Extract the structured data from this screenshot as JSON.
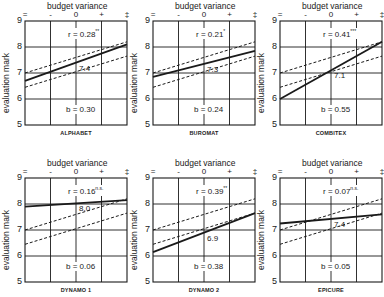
{
  "chart_data": [
    {
      "type": "line",
      "title": "ALPHABET",
      "xlabel": "budget variance",
      "ylabel": "evaluation mark",
      "x_ticks": [
        "=",
        "-",
        "0",
        "+",
        "‡"
      ],
      "y_ticks": [
        5,
        6,
        7,
        8,
        9
      ],
      "ylim": [
        5,
        9
      ],
      "grid": true,
      "series": [
        {
          "name": "regression",
          "style": "solid",
          "x": [
            -2,
            2
          ],
          "y": [
            6.7,
            8.1
          ]
        },
        {
          "name": "reference upper",
          "style": "dashed",
          "x": [
            -2,
            2
          ],
          "y": [
            7.0,
            8.2
          ]
        },
        {
          "name": "reference lower",
          "style": "dashed",
          "x": [
            -2,
            2
          ],
          "y": [
            6.45,
            7.65
          ]
        }
      ],
      "r": "0.28",
      "r_sig": "**",
      "b": "0.30",
      "mean_label": "7.4"
    },
    {
      "type": "line",
      "title": "BUROMAT",
      "xlabel": "budget variance",
      "ylabel": "evaluation mark",
      "x_ticks": [
        "=",
        "-",
        "0",
        "+",
        "‡"
      ],
      "y_ticks": [
        5,
        6,
        7,
        8,
        9
      ],
      "ylim": [
        5,
        9
      ],
      "grid": true,
      "series": [
        {
          "name": "regression",
          "style": "solid",
          "x": [
            -2,
            2
          ],
          "y": [
            6.85,
            7.85
          ]
        },
        {
          "name": "reference upper",
          "style": "dashed",
          "x": [
            -2,
            2
          ],
          "y": [
            7.0,
            8.2
          ]
        },
        {
          "name": "reference lower",
          "style": "dashed",
          "x": [
            -2,
            2
          ],
          "y": [
            6.45,
            7.65
          ]
        }
      ],
      "r": "0.21",
      "r_sig": "*",
      "b": "0.24",
      "mean_label": "7.3"
    },
    {
      "type": "line",
      "title": "COMBITEX",
      "xlabel": "budget variance",
      "ylabel": "evaluation mark",
      "x_ticks": [
        "=",
        "-",
        "0",
        "+",
        "‡"
      ],
      "y_ticks": [
        5,
        6,
        7,
        8,
        9
      ],
      "ylim": [
        5,
        9
      ],
      "grid": true,
      "series": [
        {
          "name": "regression",
          "style": "solid",
          "x": [
            -2,
            2
          ],
          "y": [
            6.0,
            8.2
          ]
        },
        {
          "name": "reference upper",
          "style": "dashed",
          "x": [
            -2,
            2
          ],
          "y": [
            7.0,
            8.2
          ]
        },
        {
          "name": "reference lower",
          "style": "dashed",
          "x": [
            -2,
            2
          ],
          "y": [
            6.45,
            7.65
          ]
        }
      ],
      "r": "0.41",
      "r_sig": "***",
      "b": "0.55",
      "mean_label": "7.1"
    },
    {
      "type": "line",
      "title": "DYNAMO 1",
      "xlabel": "budget variance",
      "ylabel": "evaluation mark",
      "x_ticks": [
        "=",
        "-",
        "0",
        "+",
        "‡"
      ],
      "y_ticks": [
        5,
        6,
        7,
        8,
        9
      ],
      "ylim": [
        5,
        9
      ],
      "grid": true,
      "series": [
        {
          "name": "regression",
          "style": "solid",
          "x": [
            -2,
            2
          ],
          "y": [
            7.9,
            8.15
          ]
        },
        {
          "name": "reference upper",
          "style": "dashed",
          "x": [
            -2,
            2
          ],
          "y": [
            7.0,
            8.2
          ]
        },
        {
          "name": "reference lower",
          "style": "dashed",
          "x": [
            -2,
            2
          ],
          "y": [
            6.45,
            7.65
          ]
        }
      ],
      "r": "0.16",
      "r_sig": "n.s.",
      "b": "0.06",
      "mean_label": "8.0"
    },
    {
      "type": "line",
      "title": "DYNAMO 2",
      "xlabel": "budget variance",
      "ylabel": "evaluation mark",
      "x_ticks": [
        "=",
        "-",
        "0",
        "+",
        "‡"
      ],
      "y_ticks": [
        5,
        6,
        7,
        8,
        9
      ],
      "ylim": [
        5,
        9
      ],
      "grid": true,
      "series": [
        {
          "name": "regression",
          "style": "solid",
          "x": [
            -2,
            2
          ],
          "y": [
            6.15,
            7.65
          ]
        },
        {
          "name": "reference upper",
          "style": "dashed",
          "x": [
            -2,
            2
          ],
          "y": [
            7.0,
            8.2
          ]
        },
        {
          "name": "reference lower",
          "style": "dashed",
          "x": [
            -2,
            2
          ],
          "y": [
            6.45,
            7.65
          ]
        }
      ],
      "r": "0.39",
      "r_sig": "**",
      "b": "0.38",
      "mean_label": "6.9"
    },
    {
      "type": "line",
      "title": "EPICURE",
      "xlabel": "budget variance",
      "ylabel": "evaluation mark",
      "x_ticks": [
        "=",
        "-",
        "0",
        "+",
        "‡"
      ],
      "y_ticks": [
        5,
        6,
        7,
        8,
        9
      ],
      "ylim": [
        5,
        9
      ],
      "grid": true,
      "series": [
        {
          "name": "regression",
          "style": "solid",
          "x": [
            -2,
            2
          ],
          "y": [
            7.25,
            7.6
          ]
        },
        {
          "name": "reference upper",
          "style": "dashed",
          "x": [
            -2,
            2
          ],
          "y": [
            7.0,
            8.2
          ]
        },
        {
          "name": "reference lower",
          "style": "dashed",
          "x": [
            -2,
            2
          ],
          "y": [
            6.45,
            7.65
          ]
        }
      ],
      "r": "0.07",
      "r_sig": "n.s.",
      "b": "0.05",
      "mean_label": "7.4"
    }
  ],
  "labels": {
    "xlabel": "budget variance",
    "ylabel": "evaluation mark",
    "r_prefix": "r = ",
    "b_prefix": "b = "
  },
  "colors": {
    "ink": "#1a1a1a",
    "grid": "#2a2a2a",
    "background": "#ffffff"
  }
}
